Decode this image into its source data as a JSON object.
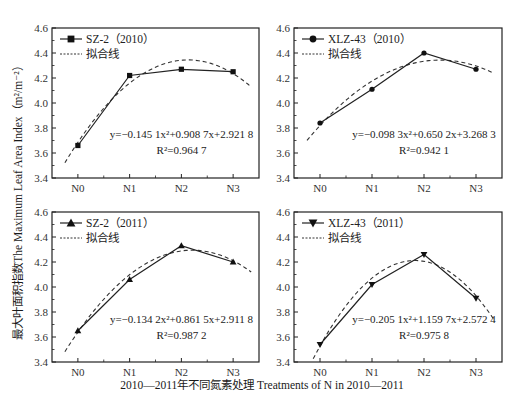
{
  "chart_data": [
    {
      "type": "line",
      "panel": "top-left",
      "legend": [
        "SZ-2（2010）",
        "拟合线"
      ],
      "marker": "square",
      "categories": [
        "N0",
        "N1",
        "N2",
        "N3"
      ],
      "values": [
        3.66,
        4.22,
        4.27,
        4.25
      ],
      "fit": {
        "a": -0.1451,
        "b": 0.9087,
        "c": 2.9218
      },
      "equation": "y=−0.145 1x²+0.908 7x+2.921 8",
      "r2": "R²=0.964 7",
      "ylim": [
        3.4,
        4.6
      ],
      "yticks": [
        "3.4",
        "3.6",
        "3.8",
        "4.0",
        "4.2",
        "4.4",
        "4.6"
      ]
    },
    {
      "type": "line",
      "panel": "top-right",
      "legend": [
        "XLZ-43（2010）",
        "拟合线"
      ],
      "marker": "circle",
      "categories": [
        "N0",
        "N1",
        "N2",
        "N3"
      ],
      "values": [
        3.84,
        4.11,
        4.4,
        4.27
      ],
      "fit": {
        "a": -0.0983,
        "b": 0.6502,
        "c": 3.2683
      },
      "equation": "y=−0.098 3x²+0.650 2x+3.268 3",
      "r2": "R²=0.942 1",
      "ylim": [
        3.4,
        4.6
      ],
      "yticks": [
        "3.4",
        "3.6",
        "3.8",
        "4.0",
        "4.2",
        "4.4",
        "4.6"
      ]
    },
    {
      "type": "line",
      "panel": "bottom-left",
      "legend": [
        "SZ-2（2011）",
        "拟合线"
      ],
      "marker": "triangle-up",
      "categories": [
        "N0",
        "N1",
        "N2",
        "N3"
      ],
      "values": [
        3.65,
        4.06,
        4.33,
        4.2
      ],
      "fit": {
        "a": -0.1342,
        "b": 0.8615,
        "c": 2.9118
      },
      "equation": "y=−0.134 2x²+0.861 5x+2.911 8",
      "r2": "R²=0.987 2",
      "ylim": [
        3.4,
        4.6
      ],
      "yticks": [
        "3.4",
        "3.6",
        "3.8",
        "4.0",
        "4.2",
        "4.4",
        "4.6"
      ]
    },
    {
      "type": "line",
      "panel": "bottom-right",
      "legend": [
        "XLZ-43（2011）",
        "拟合线"
      ],
      "marker": "triangle-down",
      "categories": [
        "N0",
        "N1",
        "N2",
        "N3"
      ],
      "values": [
        3.54,
        4.02,
        4.26,
        3.91
      ],
      "fit": {
        "a": -0.2051,
        "b": 1.1597,
        "c": 2.5724
      },
      "equation": "y=−0.205 1x²+1.159 7x+2.572 4",
      "r2": "R²=0.975 8",
      "ylim": [
        3.4,
        4.6
      ],
      "yticks": [
        "3.4",
        "3.6",
        "3.8",
        "4.0",
        "4.2",
        "4.4",
        "4.6"
      ]
    }
  ],
  "ylabel": "最大叶面积指数The Maximum Leaf Area Index（m²/m⁻²）",
  "xlabel": "2010—2011年不同氮素处理 Treatments of N in 2010—2011"
}
